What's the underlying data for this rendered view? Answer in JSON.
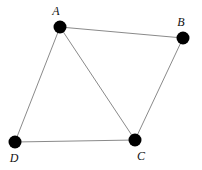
{
  "diagram": {
    "type": "graph",
    "nodes": [
      {
        "id": "A",
        "label": "A",
        "x": 60,
        "y": 27,
        "lx": 56,
        "ly": 15
      },
      {
        "id": "B",
        "label": "B",
        "x": 183,
        "y": 38,
        "lx": 181,
        "ly": 26
      },
      {
        "id": "C",
        "label": "C",
        "x": 135,
        "y": 140,
        "lx": 141,
        "ly": 160
      },
      {
        "id": "D",
        "label": "D",
        "x": 15,
        "y": 142,
        "lx": 14,
        "ly": 162
      }
    ],
    "edges": [
      {
        "from": "A",
        "to": "B"
      },
      {
        "from": "B",
        "to": "C"
      },
      {
        "from": "C",
        "to": "D"
      },
      {
        "from": "D",
        "to": "A"
      },
      {
        "from": "A",
        "to": "C"
      }
    ],
    "colors": {
      "node": "#000000",
      "edge": "#8a8a8a",
      "background": "#ffffff"
    }
  }
}
